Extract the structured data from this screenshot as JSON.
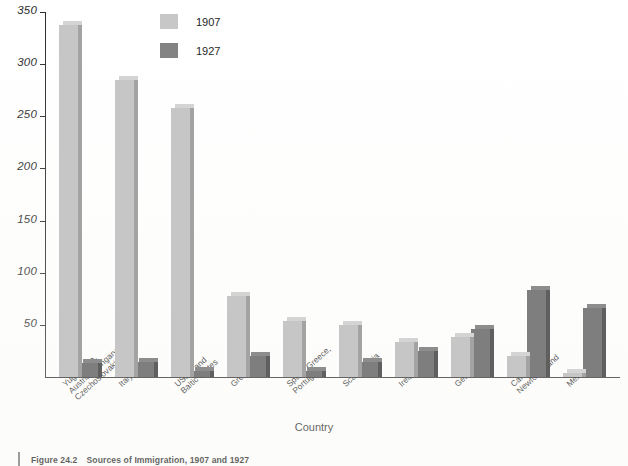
{
  "figure": {
    "caption_label": "Figure 24.2",
    "caption_title": "Sources of Immigration, 1907 and 1927"
  },
  "legend": {
    "position": "top-center-left",
    "entries": [
      {
        "label": "1907",
        "color": "#c6c6c6"
      },
      {
        "label": "1927",
        "color": "#7e7e7e"
      }
    ]
  },
  "axes": {
    "y_title": "Immigrants (in Thousands)",
    "x_title": "Country",
    "y_ticks": [
      "350",
      "300",
      "250",
      "200",
      "150",
      "100",
      "50"
    ]
  },
  "chart_data": {
    "type": "bar",
    "title": "Sources of Immigration, 1907 and 1927",
    "xlabel": "Country",
    "ylabel": "Immigrants (in Thousands)",
    "ylim": [
      0,
      350
    ],
    "ytick_step": 50,
    "grid": false,
    "legend_position": "top-center",
    "categories": [
      "Yugoslavia,\nAustria, Hungary,\nCzechoslovakia",
      "Italy",
      "USSR and\nBaltic States",
      "Great Britain",
      "Spain, Greece,\nPortugal",
      "Scandinavia",
      "Ireland",
      "Germany",
      "Canada and\nNewfoundland",
      "Mexico"
    ],
    "series": [
      {
        "name": "1907",
        "color": "#c6c6c6",
        "values": [
          338,
          285,
          258,
          78,
          54,
          50,
          34,
          38,
          20,
          4
        ]
      },
      {
        "name": "1927",
        "color": "#7e7e7e",
        "values": [
          13,
          14,
          6,
          20,
          6,
          14,
          25,
          46,
          83,
          66
        ]
      }
    ]
  }
}
